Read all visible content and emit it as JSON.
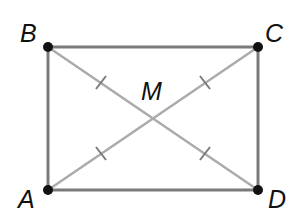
{
  "diagram": {
    "type": "rectangle-with-diagonals",
    "points": {
      "A": {
        "label": "A",
        "x": 48,
        "y": 190,
        "lx": 18,
        "ly": 206
      },
      "B": {
        "label": "B",
        "x": 48,
        "y": 47,
        "lx": 20,
        "ly": 42
      },
      "C": {
        "label": "C",
        "x": 258,
        "y": 47,
        "lx": 267,
        "ly": 42
      },
      "D": {
        "label": "D",
        "x": 258,
        "y": 190,
        "lx": 270,
        "ly": 210
      },
      "M": {
        "label": "M",
        "x": 153,
        "y": 118,
        "lx": 140,
        "ly": 101
      }
    },
    "edges": [
      [
        "A",
        "B"
      ],
      [
        "B",
        "C"
      ],
      [
        "C",
        "D"
      ],
      [
        "D",
        "A"
      ]
    ],
    "diagonals": [
      [
        "B",
        "D"
      ],
      [
        "A",
        "C"
      ]
    ],
    "congruence_ticks": [
      "BM",
      "MC",
      "AM",
      "MD"
    ],
    "colors": {
      "edge": "#7a7a7a",
      "diagonal": "#ababab",
      "point": "#111111",
      "label": "#111111"
    }
  }
}
